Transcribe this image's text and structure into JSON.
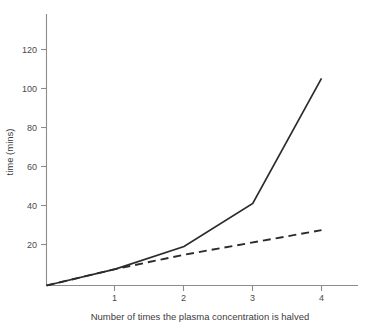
{
  "chart_data": {
    "type": "line",
    "title": "",
    "subtitle": "",
    "xlabel": "Number of times the plasma concentration is halved",
    "ylabel": "time (mins)",
    "xlim": [
      0,
      4.55
    ],
    "ylim": [
      0,
      135
    ],
    "xticks": [
      1,
      2,
      3,
      4
    ],
    "xtick_labels": [
      "1",
      "2",
      "3",
      "4"
    ],
    "yticks": [
      20,
      40,
      60,
      80,
      100,
      120
    ],
    "ytick_labels": [
      "20",
      "40",
      "60",
      "80",
      "100",
      "120"
    ],
    "grid": false,
    "legend": "none",
    "annotations": [],
    "series": [
      {
        "name": "solid-curve",
        "style": "solid",
        "color": "#2b2b2b",
        "x": [
          0,
          1,
          2,
          3,
          4
        ],
        "values": [
          0,
          8,
          19,
          40,
          101
        ]
      },
      {
        "name": "dashed-curve",
        "style": "dashed",
        "color": "#2b2b2b",
        "x": [
          0,
          1,
          2,
          4
        ],
        "values": [
          0,
          8,
          15,
          27
        ]
      }
    ]
  },
  "axes": {
    "y_label_text": "time (mins)",
    "x_label_text": "Number of times the plasma concentration is halved"
  }
}
